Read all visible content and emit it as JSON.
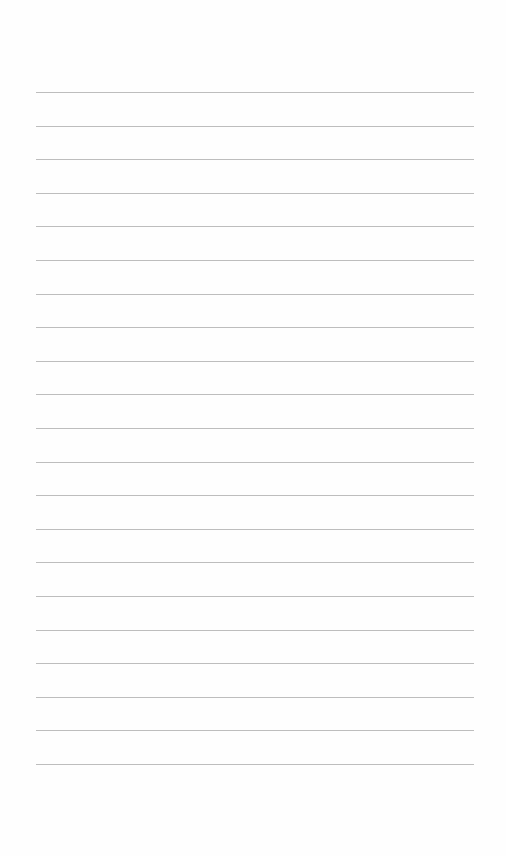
{
  "page": {
    "type": "lined-paper",
    "background_color": "#fefefe",
    "rule_color": "#bdbdbd",
    "rule_count": 21,
    "first_rule_y": 92,
    "rule_spacing": 33.6,
    "rule_left": 36,
    "rule_width": 438,
    "text": []
  }
}
